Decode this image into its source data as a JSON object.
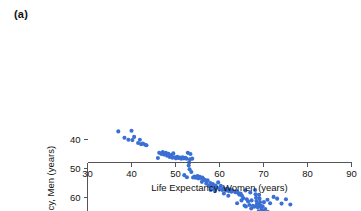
{
  "figure": {
    "panel_label": "(a)",
    "marker_color": "#3A6FD4",
    "axis_color": "#555555",
    "text_color": "#141414",
    "background": "#ffffff"
  },
  "chart_data": {
    "type": "scatter",
    "title": "",
    "xlabel": "Life Expectancy, Women (years)",
    "ylabel": "Life Expectancy, Men (years)",
    "xlim": [
      30,
      90
    ],
    "ylim": [
      33,
      82
    ],
    "xticks": [
      30,
      40,
      50,
      60,
      70,
      80,
      90
    ],
    "yticks": [
      40,
      50,
      60,
      70,
      80
    ],
    "xtick_labels": [
      "30",
      "40",
      "50",
      "60",
      "70",
      "80",
      "90"
    ],
    "ytick_labels": [
      "40",
      "50",
      "60",
      "70",
      "80"
    ],
    "grid": false,
    "legend": null,
    "marker_size": 3.0,
    "series": [
      {
        "name": "Countries",
        "color": "#3A6FD4",
        "points": [
          [
            37.0,
            37.2
          ],
          [
            38.4,
            39.4
          ],
          [
            39.3,
            40.1
          ],
          [
            40.0,
            37.0
          ],
          [
            40.2,
            40.2
          ],
          [
            40.6,
            39.1
          ],
          [
            41.5,
            41.2
          ],
          [
            41.9,
            40.1
          ],
          [
            42.2,
            41.6
          ],
          [
            42.6,
            41.4
          ],
          [
            43.1,
            41.8
          ],
          [
            43.4,
            42.0
          ],
          [
            46.0,
            46.4
          ],
          [
            46.3,
            44.6
          ],
          [
            46.8,
            45.0
          ],
          [
            47.1,
            44.3
          ],
          [
            47.4,
            45.2
          ],
          [
            47.8,
            44.6
          ],
          [
            48.1,
            45.6
          ],
          [
            48.4,
            44.9
          ],
          [
            48.7,
            46.0
          ],
          [
            49.0,
            45.4
          ],
          [
            49.3,
            46.3
          ],
          [
            49.5,
            44.8
          ],
          [
            49.8,
            46.1
          ],
          [
            50.1,
            46.5
          ],
          [
            50.4,
            46.0
          ],
          [
            50.7,
            46.4
          ],
          [
            51.0,
            46.2
          ],
          [
            51.3,
            46.6
          ],
          [
            51.6,
            46.1
          ],
          [
            51.9,
            46.5
          ],
          [
            52.2,
            46.3
          ],
          [
            52.5,
            46.6
          ],
          [
            52.8,
            44.6
          ],
          [
            53.0,
            49.0
          ],
          [
            53.1,
            47.9
          ],
          [
            53.2,
            50.3
          ],
          [
            53.3,
            46.8
          ],
          [
            53.4,
            45.0
          ],
          [
            53.6,
            51.2
          ],
          [
            53.8,
            46.6
          ],
          [
            52.0,
            52.3
          ],
          [
            52.6,
            53.0
          ],
          [
            54.0,
            53.1
          ],
          [
            54.3,
            52.8
          ],
          [
            54.6,
            53.2
          ],
          [
            54.9,
            53.0
          ],
          [
            55.2,
            53.4
          ],
          [
            55.5,
            52.9
          ],
          [
            55.8,
            53.3
          ],
          [
            56.1,
            53.1
          ],
          [
            56.4,
            53.6
          ],
          [
            56.7,
            54.0
          ],
          [
            57.0,
            55.2
          ],
          [
            57.3,
            54.1
          ],
          [
            57.6,
            56.0
          ],
          [
            57.9,
            55.0
          ],
          [
            58.2,
            56.2
          ],
          [
            58.5,
            55.4
          ],
          [
            58.8,
            57.0
          ],
          [
            59.1,
            55.9
          ],
          [
            59.4,
            56.6
          ],
          [
            59.7,
            54.8
          ],
          [
            60.0,
            57.1
          ],
          [
            60.3,
            56.0
          ],
          [
            60.6,
            57.4
          ],
          [
            60.9,
            56.8
          ],
          [
            61.2,
            57.2
          ],
          [
            61.5,
            57.6
          ],
          [
            61.8,
            57.0
          ],
          [
            62.1,
            57.8
          ],
          [
            62.4,
            57.3
          ],
          [
            62.7,
            58.0
          ],
          [
            63.0,
            57.6
          ],
          [
            63.3,
            68.8
          ],
          [
            63.6,
            58.2
          ],
          [
            63.9,
            57.9
          ],
          [
            64.2,
            58.4
          ],
          [
            64.5,
            59.0
          ],
          [
            64.8,
            58.6
          ],
          [
            65.1,
            59.4
          ],
          [
            65.4,
            60.2
          ],
          [
            65.7,
            62.8
          ],
          [
            65.9,
            57.6
          ],
          [
            66.2,
            60.6
          ],
          [
            66.5,
            61.4
          ],
          [
            66.8,
            62.6
          ],
          [
            67.0,
            58.3
          ],
          [
            67.3,
            61.0
          ],
          [
            67.6,
            62.9
          ],
          [
            67.9,
            63.2
          ],
          [
            68.1,
            57.4
          ],
          [
            68.2,
            58.9
          ],
          [
            68.3,
            60.1
          ],
          [
            68.4,
            61.2
          ],
          [
            68.5,
            62.3
          ],
          [
            68.6,
            63.0
          ],
          [
            68.7,
            63.4
          ],
          [
            68.8,
            62.6
          ],
          [
            69.0,
            59.1
          ],
          [
            69.1,
            60.4
          ],
          [
            69.2,
            61.6
          ],
          [
            69.3,
            62.8
          ],
          [
            69.4,
            63.3
          ],
          [
            69.6,
            64.2
          ],
          [
            69.8,
            63.0
          ],
          [
            70.0,
            64.6
          ],
          [
            70.2,
            65.2
          ],
          [
            70.4,
            64.0
          ],
          [
            70.6,
            65.6
          ],
          [
            70.8,
            66.0
          ],
          [
            71.0,
            65.0
          ],
          [
            71.2,
            66.4
          ],
          [
            71.4,
            66.8
          ],
          [
            71.6,
            65.8
          ],
          [
            71.8,
            67.0
          ],
          [
            72.0,
            66.2
          ],
          [
            72.2,
            67.2
          ],
          [
            72.4,
            66.6
          ],
          [
            72.6,
            67.4
          ],
          [
            72.8,
            66.9
          ],
          [
            73.0,
            67.6
          ],
          [
            73.2,
            67.1
          ],
          [
            73.4,
            67.8
          ],
          [
            73.6,
            67.3
          ],
          [
            73.8,
            68.0
          ],
          [
            74.0,
            67.5
          ],
          [
            74.2,
            68.2
          ],
          [
            74.4,
            67.8
          ],
          [
            74.6,
            68.4
          ],
          [
            74.8,
            68.0
          ],
          [
            75.0,
            68.6
          ],
          [
            75.2,
            68.2
          ],
          [
            75.4,
            68.8
          ],
          [
            75.6,
            68.4
          ],
          [
            75.8,
            69.0
          ],
          [
            76.0,
            68.6
          ],
          [
            76.2,
            69.2
          ],
          [
            76.4,
            68.8
          ],
          [
            76.6,
            69.4
          ],
          [
            76.8,
            69.0
          ],
          [
            77.0,
            69.6
          ],
          [
            77.2,
            69.2
          ],
          [
            77.4,
            69.8
          ],
          [
            77.6,
            70.2
          ],
          [
            77.8,
            69.6
          ],
          [
            78.0,
            70.4
          ],
          [
            78.2,
            70.0
          ],
          [
            78.4,
            70.8
          ],
          [
            78.6,
            70.3
          ],
          [
            78.8,
            71.2
          ],
          [
            79.0,
            70.6
          ],
          [
            79.2,
            71.6
          ],
          [
            79.4,
            71.0
          ],
          [
            79.6,
            72.0
          ],
          [
            79.8,
            71.4
          ],
          [
            80.0,
            72.4
          ],
          [
            80.2,
            71.8
          ],
          [
            80.4,
            72.8
          ],
          [
            80.6,
            72.2
          ],
          [
            80.8,
            73.2
          ],
          [
            81.0,
            72.6
          ],
          [
            81.2,
            73.6
          ],
          [
            81.4,
            73.0
          ],
          [
            81.6,
            74.0
          ],
          [
            81.8,
            73.4
          ],
          [
            82.0,
            74.4
          ],
          [
            82.2,
            73.8
          ],
          [
            82.4,
            74.8
          ],
          [
            82.6,
            74.2
          ],
          [
            82.8,
            75.2
          ],
          [
            83.0,
            74.6
          ],
          [
            83.2,
            75.6
          ],
          [
            83.4,
            75.0
          ],
          [
            83.6,
            76.0
          ],
          [
            83.8,
            75.4
          ],
          [
            84.0,
            76.4
          ],
          [
            84.4,
            77.2
          ],
          [
            87.2,
            80.1
          ],
          [
            70.1,
            61.6
          ],
          [
            70.9,
            60.8
          ],
          [
            71.5,
            62.0
          ],
          [
            72.3,
            59.8
          ],
          [
            73.1,
            60.4
          ],
          [
            74.1,
            62.1
          ],
          [
            75.1,
            60.6
          ],
          [
            76.1,
            62.4
          ],
          [
            69.5,
            66.8
          ],
          [
            70.5,
            67.4
          ],
          [
            71.1,
            67.8
          ],
          [
            72.1,
            68.2
          ],
          [
            73.5,
            68.9
          ],
          [
            74.5,
            69.3
          ],
          [
            75.5,
            69.8
          ],
          [
            76.5,
            70.2
          ],
          [
            77.5,
            71.0
          ],
          [
            78.5,
            71.8
          ],
          [
            79.5,
            72.6
          ],
          [
            80.5,
            73.4
          ],
          [
            81.5,
            74.2
          ],
          [
            82.5,
            75.0
          ],
          [
            83.5,
            75.8
          ],
          [
            84.2,
            76.8
          ],
          [
            66.0,
            63.1
          ],
          [
            67.2,
            63.8
          ],
          [
            68.9,
            64.8
          ],
          [
            69.9,
            65.4
          ],
          [
            64.0,
            62.0
          ],
          [
            65.0,
            61.0
          ],
          [
            62.0,
            59.4
          ],
          [
            61.0,
            58.6
          ],
          [
            59.0,
            57.8
          ],
          [
            58.0,
            57.4
          ],
          [
            56.0,
            54.6
          ],
          [
            55.0,
            52.6
          ]
        ]
      }
    ]
  }
}
